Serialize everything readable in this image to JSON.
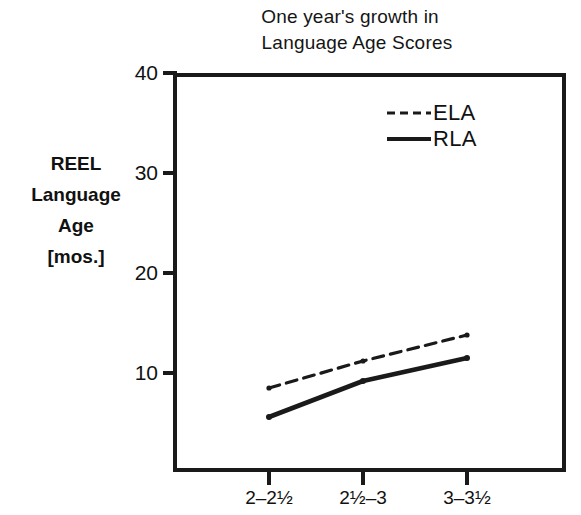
{
  "title": {
    "line1": "One year's growth in",
    "line2": "Language Age Scores"
  },
  "y_axis_title": {
    "line1": "REEL",
    "line2": "Language",
    "line3": "Age",
    "line4": "[mos.]"
  },
  "legend": {
    "items": [
      {
        "label": "ELA",
        "style": "dashed",
        "color": "#1a1a1a"
      },
      {
        "label": "RLA",
        "style": "solid",
        "color": "#1a1a1a"
      }
    ]
  },
  "axis": {
    "y_ticks": [
      "40",
      "30",
      "20",
      "10"
    ],
    "x_ticks": [
      "2–2½",
      "2½–3",
      "3–3½"
    ]
  },
  "chart_data": {
    "type": "line",
    "title": "One year's growth in Language Age Scores",
    "xlabel": "",
    "ylabel": "REEL Language Age [mos.]",
    "categories": [
      "2–2½",
      "2½–3",
      "3–3½"
    ],
    "series": [
      {
        "name": "ELA",
        "style": "dashed",
        "values": [
          8.5,
          11.2,
          13.8
        ]
      },
      {
        "name": "RLA",
        "style": "solid",
        "values": [
          5.6,
          9.2,
          11.5
        ]
      }
    ],
    "ylim": [
      0,
      40
    ],
    "yticks": [
      10,
      20,
      30,
      40
    ],
    "grid": false,
    "legend_position": "upper-right-inside"
  }
}
